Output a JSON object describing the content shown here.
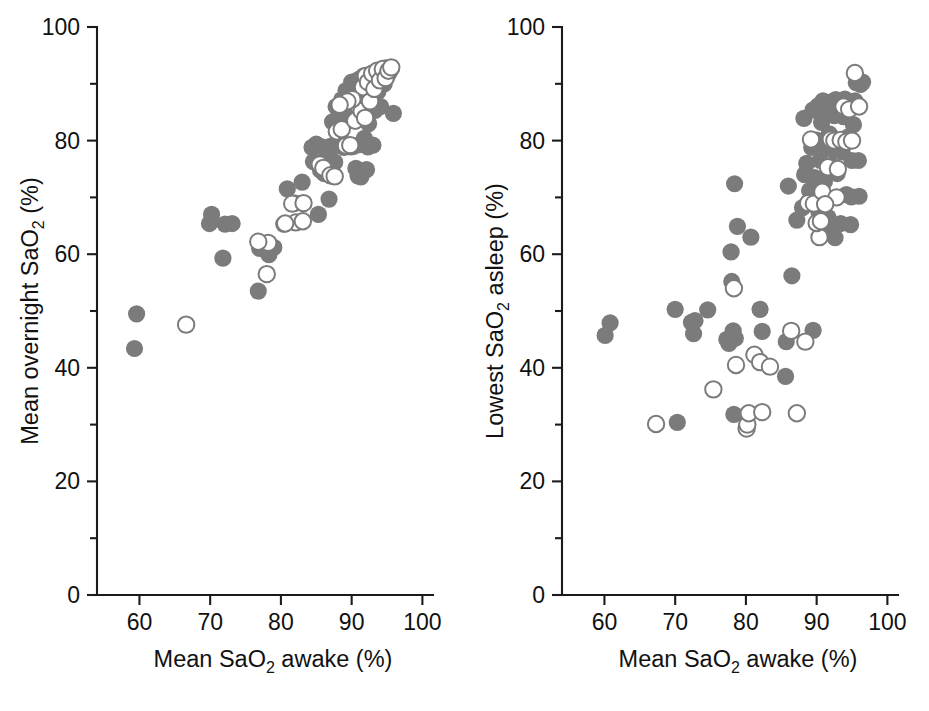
{
  "figure": {
    "panel_count": 2,
    "background": "#ffffff",
    "marker_filled_color": "#7b7b7b",
    "marker_open_color": "#7b7b7b"
  },
  "chart_data": [
    {
      "type": "scatter",
      "panel": "left",
      "title": "",
      "xlabel": "Mean SaO2 awake (%)",
      "xlabel_parts": {
        "pre": "Mean SaO",
        "sub": "2",
        "post": " awake (%)"
      },
      "ylabel": "Mean overnight SaO2 (%)",
      "ylabel_parts": {
        "pre": "Mean overnight SaO",
        "sub": "2",
        "post": " (%)"
      },
      "xlim": [
        54,
        101.5
      ],
      "ylim": [
        0,
        100
      ],
      "xticks": [
        60,
        70,
        80,
        90,
        100
      ],
      "xticklabels": [
        "60",
        "70",
        "80",
        "90",
        "100"
      ],
      "yticks": [
        0,
        20,
        40,
        60,
        80,
        100
      ],
      "yticklabels": [
        "0",
        "20",
        "40",
        "60",
        "80",
        "100"
      ],
      "yminorticks": [
        10,
        30,
        50,
        70,
        90
      ],
      "grid": false,
      "legend": "none",
      "series": [
        {
          "name": "filled",
          "marker": "filled-circle",
          "points": [
            [
              59.3,
              43.4
            ],
            [
              59.6,
              49.5
            ],
            [
              69.9,
              65.4
            ],
            [
              70.2,
              67.0
            ],
            [
              72.1,
              65.3
            ],
            [
              73.1,
              65.4
            ],
            [
              71.8,
              59.3
            ],
            [
              76.8,
              53.5
            ],
            [
              77.0,
              61.0
            ],
            [
              77.8,
              61.7
            ],
            [
              78.3,
              59.9
            ],
            [
              79.0,
              61.2
            ],
            [
              80.4,
              65.3
            ],
            [
              80.9,
              71.5
            ],
            [
              82.0,
              69.0
            ],
            [
              83.0,
              72.7
            ],
            [
              84.4,
              78.8
            ],
            [
              84.6,
              76.3
            ],
            [
              85.0,
              79.4
            ],
            [
              85.3,
              67.0
            ],
            [
              85.6,
              74.8
            ],
            [
              86.1,
              74.2
            ],
            [
              86.3,
              78.7
            ],
            [
              86.8,
              69.7
            ],
            [
              87.0,
              79.0
            ],
            [
              87.3,
              83.3
            ],
            [
              87.4,
              79.1
            ],
            [
              87.8,
              86.0
            ],
            [
              88.0,
              79.2
            ],
            [
              88.2,
              84.9
            ],
            [
              88.4,
              81.3
            ],
            [
              88.6,
              87.2
            ],
            [
              88.8,
              79.0
            ],
            [
              89.0,
              85.2
            ],
            [
              89.2,
              88.8
            ],
            [
              89.4,
              83.6
            ],
            [
              89.6,
              79.1
            ],
            [
              89.8,
              86.4
            ],
            [
              90.0,
              90.3
            ],
            [
              90.2,
              84.2
            ],
            [
              90.3,
              79.0
            ],
            [
              90.5,
              88.0
            ],
            [
              90.6,
              75.1
            ],
            [
              90.8,
              86.8
            ],
            [
              91.0,
              90.8
            ],
            [
              91.1,
              79.3
            ],
            [
              91.2,
              84.6
            ],
            [
              91.4,
              74.6
            ],
            [
              91.5,
              88.3
            ],
            [
              91.7,
              91.4
            ],
            [
              91.8,
              80.4
            ],
            [
              92.0,
              86.2
            ],
            [
              92.1,
              74.9
            ],
            [
              92.2,
              89.0
            ],
            [
              92.4,
              83.0
            ],
            [
              92.6,
              91.0
            ],
            [
              92.8,
              87.5
            ],
            [
              93.0,
              79.2
            ],
            [
              93.1,
              90.0
            ],
            [
              93.3,
              85.3
            ],
            [
              93.5,
              92.0
            ],
            [
              93.7,
              88.6
            ],
            [
              93.9,
              91.2
            ],
            [
              94.1,
              86.0
            ],
            [
              94.3,
              92.4
            ],
            [
              94.6,
              90.0
            ],
            [
              94.8,
              92.8
            ],
            [
              95.0,
              91.3
            ],
            [
              95.3,
              92.0
            ],
            [
              95.6,
              92.6
            ],
            [
              95.9,
              84.8
            ],
            [
              86.5,
              77.0
            ],
            [
              87.6,
              76.2
            ],
            [
              90.9,
              73.8
            ],
            [
              91.3,
              73.6
            ],
            [
              92.3,
              78.9
            ],
            [
              89.9,
              78.9
            ],
            [
              88.9,
              78.8
            ],
            [
              87.2,
              78.9
            ],
            [
              85.8,
              78.9
            ]
          ]
        },
        {
          "name": "open",
          "marker": "open-circle",
          "points": [
            [
              66.6,
              47.6
            ],
            [
              78.0,
              56.5
            ],
            [
              78.2,
              62.0
            ],
            [
              76.8,
              62.2
            ],
            [
              82.1,
              65.6
            ],
            [
              83.1,
              65.8
            ],
            [
              80.6,
              65.4
            ],
            [
              81.6,
              68.9
            ],
            [
              83.2,
              69.0
            ],
            [
              85.5,
              75.8
            ],
            [
              86.0,
              75.2
            ],
            [
              87.0,
              73.9
            ],
            [
              87.6,
              73.7
            ],
            [
              87.9,
              81.6
            ],
            [
              88.6,
              82.0
            ],
            [
              89.2,
              79.1
            ],
            [
              89.8,
              79.2
            ],
            [
              90.5,
              83.5
            ],
            [
              90.9,
              86.2
            ],
            [
              91.4,
              85.2
            ],
            [
              91.6,
              89.4
            ],
            [
              92.0,
              91.4
            ],
            [
              92.3,
              90.3
            ],
            [
              92.6,
              86.9
            ],
            [
              92.9,
              91.8
            ],
            [
              93.2,
              89.1
            ],
            [
              93.6,
              92.3
            ],
            [
              94.0,
              90.6
            ],
            [
              94.4,
              92.6
            ],
            [
              94.8,
              91.0
            ],
            [
              95.2,
              92.3
            ],
            [
              95.6,
              92.9
            ],
            [
              90.1,
              87.3
            ],
            [
              89.4,
              86.9
            ],
            [
              88.3,
              86.3
            ],
            [
              91.9,
              84.0
            ]
          ]
        }
      ]
    },
    {
      "type": "scatter",
      "panel": "right",
      "title": "",
      "xlabel": "Mean SaO2 awake (%)",
      "xlabel_parts": {
        "pre": "Mean SaO",
        "sub": "2",
        "post": " awake (%)"
      },
      "ylabel": "Lowest SaO2 asleep (%)",
      "ylabel_parts": {
        "pre": "Lowest SaO",
        "sub": "2",
        "post": " asleep (%)"
      },
      "xlim": [
        54,
        101.5
      ],
      "ylim": [
        0,
        100
      ],
      "xticks": [
        60,
        70,
        80,
        90,
        100
      ],
      "xticklabels": [
        "60",
        "70",
        "80",
        "90",
        "100"
      ],
      "yticks": [
        0,
        20,
        40,
        60,
        80,
        100
      ],
      "yticklabels": [
        "0",
        "20",
        "40",
        "60",
        "80",
        "100"
      ],
      "yminorticks": [
        10,
        30,
        50,
        70,
        90
      ],
      "grid": false,
      "legend": "none",
      "series": [
        {
          "name": "filled",
          "marker": "filled-circle",
          "points": [
            [
              60.1,
              45.7
            ],
            [
              60.8,
              47.9
            ],
            [
              70.0,
              50.3
            ],
            [
              70.3,
              30.4
            ],
            [
              72.3,
              48.0
            ],
            [
              72.8,
              48.3
            ],
            [
              72.6,
              46.0
            ],
            [
              74.6,
              50.2
            ],
            [
              77.3,
              45.0
            ],
            [
              77.6,
              44.3
            ],
            [
              78.2,
              46.5
            ],
            [
              78.5,
              45.2
            ],
            [
              78.3,
              31.8
            ],
            [
              78.0,
              55.2
            ],
            [
              78.4,
              72.4
            ],
            [
              78.8,
              64.9
            ],
            [
              77.9,
              60.4
            ],
            [
              80.7,
              63.0
            ],
            [
              82.3,
              46.4
            ],
            [
              82.0,
              50.3
            ],
            [
              85.6,
              38.5
            ],
            [
              85.7,
              44.6
            ],
            [
              86.5,
              56.2
            ],
            [
              89.5,
              46.6
            ],
            [
              86.0,
              72.0
            ],
            [
              87.2,
              66.0
            ],
            [
              88.0,
              68.2
            ],
            [
              88.3,
              74.0
            ],
            [
              88.6,
              76.0
            ],
            [
              88.2,
              83.9
            ],
            [
              89.0,
              71.2
            ],
            [
              89.3,
              78.8
            ],
            [
              89.5,
              85.4
            ],
            [
              89.7,
              73.5
            ],
            [
              90.0,
              80.1
            ],
            [
              90.2,
              86.1
            ],
            [
              90.3,
              67.5
            ],
            [
              90.5,
              76.5
            ],
            [
              90.7,
              83.2
            ],
            [
              90.9,
              87.0
            ],
            [
              91.1,
              72.8
            ],
            [
              91.2,
              79.0
            ],
            [
              91.4,
              85.0
            ],
            [
              91.6,
              66.5
            ],
            [
              91.8,
              81.2
            ],
            [
              92.0,
              86.8
            ],
            [
              92.2,
              75.6
            ],
            [
              92.3,
              78.3
            ],
            [
              92.5,
              84.4
            ],
            [
              92.7,
              87.2
            ],
            [
              92.9,
              74.2
            ],
            [
              93.0,
              80.0
            ],
            [
              93.2,
              85.8
            ],
            [
              93.4,
              65.4
            ],
            [
              93.6,
              78.0
            ],
            [
              93.8,
              84.2
            ],
            [
              94.0,
              87.3
            ],
            [
              94.2,
              70.5
            ],
            [
              94.4,
              80.6
            ],
            [
              94.6,
              86.0
            ],
            [
              94.8,
              65.2
            ],
            [
              95.0,
              76.5
            ],
            [
              95.2,
              82.8
            ],
            [
              95.4,
              87.0
            ],
            [
              95.6,
              90.2
            ],
            [
              95.9,
              76.5
            ],
            [
              96.2,
              89.9
            ],
            [
              96.5,
              90.3
            ],
            [
              96.0,
              70.2
            ],
            [
              94.9,
              70.1
            ],
            [
              92.6,
              62.9
            ],
            [
              91.9,
              64.8
            ]
          ]
        },
        {
          "name": "open",
          "marker": "open-circle",
          "points": [
            [
              67.3,
              30.1
            ],
            [
              75.4,
              36.2
            ],
            [
              78.6,
              40.5
            ],
            [
              78.3,
              54.0
            ],
            [
              80.1,
              29.3
            ],
            [
              80.2,
              30.0
            ],
            [
              80.4,
              32.0
            ],
            [
              81.2,
              42.3
            ],
            [
              82.0,
              41.0
            ],
            [
              82.3,
              32.2
            ],
            [
              83.4,
              40.2
            ],
            [
              86.4,
              46.5
            ],
            [
              87.2,
              32.0
            ],
            [
              88.4,
              44.6
            ],
            [
              88.8,
              69.0
            ],
            [
              89.6,
              68.9
            ],
            [
              90.4,
              63.0
            ],
            [
              90.0,
              65.5
            ],
            [
              90.6,
              65.8
            ],
            [
              90.8,
              71.0
            ],
            [
              91.6,
              75.3
            ],
            [
              92.0,
              80.2
            ],
            [
              92.5,
              80.0
            ],
            [
              92.8,
              70.0
            ],
            [
              93.4,
              80.1
            ],
            [
              93.8,
              86.0
            ],
            [
              94.2,
              79.8
            ],
            [
              94.6,
              85.5
            ],
            [
              95.0,
              80.0
            ],
            [
              95.4,
              91.9
            ],
            [
              96.0,
              86.0
            ],
            [
              89.2,
              80.2
            ],
            [
              91.2,
              68.8
            ],
            [
              93.0,
              75.0
            ]
          ]
        }
      ]
    }
  ]
}
